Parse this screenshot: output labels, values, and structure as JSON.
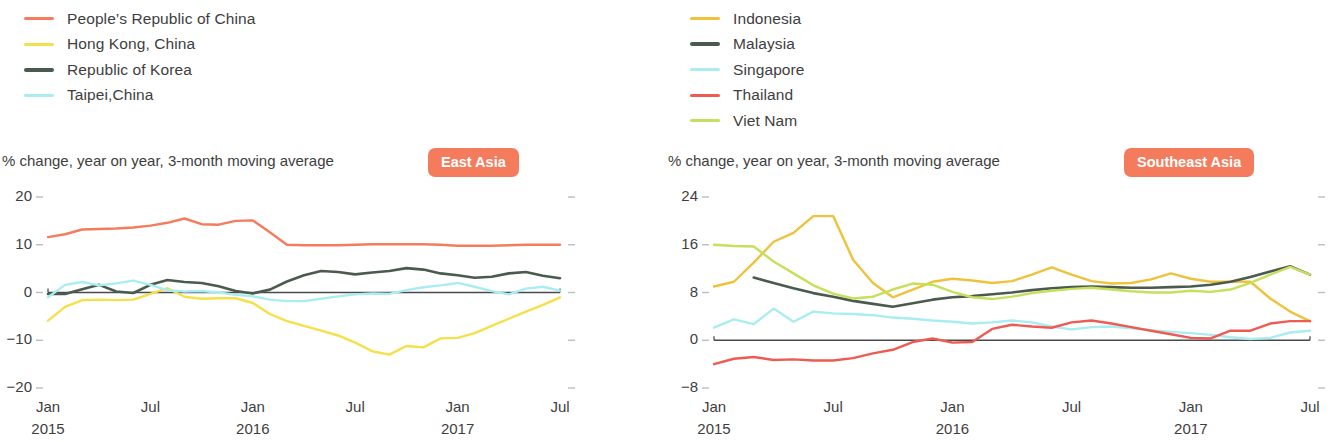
{
  "panels": [
    {
      "badge": "East Asia",
      "subtitle": "% change, year on year, 3-month moving average",
      "legend": [
        {
          "label": "People’s Republic of China",
          "color": "#F47C5C"
        },
        {
          "label": "Hong Kong, China",
          "color": "#F5E04A"
        },
        {
          "label": "Republic of Korea",
          "color": "#4A5B4E"
        },
        {
          "label": "Taipei,China",
          "color": "#A9EDF2"
        }
      ]
    },
    {
      "badge": "Southeast Asia",
      "subtitle": "% change, year on year, 3-month moving average",
      "legend": [
        {
          "label": "Indonesia",
          "color": "#EFC23C"
        },
        {
          "label": "Malaysia",
          "color": "#4A5B4E"
        },
        {
          "label": "Singapore",
          "color": "#A9EDF2"
        },
        {
          "label": "Thailand",
          "color": "#EE5B52"
        },
        {
          "label": "Viet Nam",
          "color": "#C5E05A"
        }
      ]
    }
  ],
  "chart_data": [
    {
      "type": "line",
      "title": "East Asia",
      "subtitle": "% change, year on year, 3-month moving average",
      "xlabel": "",
      "ylabel": "% change, year on year, 3-month moving average",
      "ylim": [
        -20,
        20
      ],
      "yticks": [
        20,
        10,
        0,
        -10,
        -20
      ],
      "xticks": [
        "Jan 2015",
        "Jul",
        "Jan 2016",
        "Jul",
        "Jan 2017",
        "Jul"
      ],
      "x": [
        "2015-01",
        "2015-02",
        "2015-03",
        "2015-04",
        "2015-05",
        "2015-06",
        "2015-07",
        "2015-08",
        "2015-09",
        "2015-10",
        "2015-11",
        "2015-12",
        "2016-01",
        "2016-02",
        "2016-03",
        "2016-04",
        "2016-05",
        "2016-06",
        "2016-07",
        "2016-08",
        "2016-09",
        "2016-10",
        "2016-11",
        "2016-12",
        "2017-01",
        "2017-02",
        "2017-03",
        "2017-04",
        "2017-05",
        "2017-06",
        "2017-07"
      ],
      "grid": false,
      "legend_position": "above-left",
      "series": [
        {
          "name": "People’s Republic of China",
          "color": "#F47C5C",
          "values": [
            11.6,
            12.2,
            13.2,
            13.3,
            13.4,
            13.6,
            14.0,
            14.6,
            15.5,
            14.3,
            14.2,
            15.0,
            15.1,
            12.6,
            10.0,
            9.9,
            9.9,
            9.9,
            10.0,
            10.1,
            10.1,
            10.1,
            10.1,
            10.0,
            9.8,
            9.8,
            9.8,
            9.9,
            10.0,
            10.0,
            10.0
          ]
        },
        {
          "name": "Hong Kong, China",
          "color": "#F5E04A",
          "values": [
            -5.9,
            -3.0,
            -1.6,
            -1.5,
            -1.6,
            -1.5,
            -0.3,
            0.9,
            -0.9,
            -1.3,
            -1.2,
            -1.2,
            -2.2,
            -4.5,
            -6.0,
            -7.0,
            -8.0,
            -9.0,
            -10.5,
            -12.3,
            -13.0,
            -11.2,
            -11.5,
            -9.6,
            -9.5,
            -8.5,
            -7.0,
            -5.5,
            -4.0,
            -2.6,
            -1.0
          ]
        },
        {
          "name": "Republic of Korea",
          "color": "#4A5B4E",
          "values": [
            -0.3,
            -0.3,
            0.7,
            1.6,
            0.2,
            -0.1,
            1.6,
            2.6,
            2.2,
            2.0,
            1.3,
            0.3,
            -0.2,
            0.6,
            2.3,
            3.6,
            4.5,
            4.3,
            3.8,
            4.2,
            4.5,
            5.1,
            4.8,
            4.0,
            3.6,
            3.1,
            3.3,
            4.0,
            4.3,
            3.5,
            3.0
          ]
        },
        {
          "name": "Taipei,China",
          "color": "#A9EDF2",
          "values": [
            -1.0,
            1.6,
            2.2,
            1.5,
            1.9,
            2.5,
            1.6,
            0.5,
            0.2,
            0.3,
            0.0,
            -0.5,
            -0.8,
            -1.5,
            -1.8,
            -1.8,
            -1.3,
            -0.8,
            -0.4,
            -0.2,
            -0.3,
            0.5,
            1.1,
            1.5,
            2.0,
            1.2,
            0.3,
            -0.4,
            0.8,
            1.2,
            0.4
          ]
        }
      ]
    },
    {
      "type": "line",
      "title": "Southeast Asia",
      "subtitle": "% change, year on year, 3-month moving average",
      "xlabel": "",
      "ylabel": "% change, year on year, 3-month moving average",
      "ylim": [
        -8,
        24
      ],
      "yticks": [
        24,
        16,
        8,
        0,
        -8
      ],
      "xticks": [
        "Jan 2015",
        "Jul",
        "Jan 2016",
        "Jul",
        "Jan 2017",
        "Jul"
      ],
      "x": [
        "2015-01",
        "2015-02",
        "2015-03",
        "2015-04",
        "2015-05",
        "2015-06",
        "2015-07",
        "2015-08",
        "2015-09",
        "2015-10",
        "2015-11",
        "2015-12",
        "2016-01",
        "2016-02",
        "2016-03",
        "2016-04",
        "2016-05",
        "2016-06",
        "2016-07",
        "2016-08",
        "2016-09",
        "2016-10",
        "2016-11",
        "2016-12",
        "2017-01",
        "2017-02",
        "2017-03",
        "2017-04",
        "2017-05",
        "2017-06",
        "2017-07"
      ],
      "grid": false,
      "legend_position": "above-left",
      "series": [
        {
          "name": "Indonesia",
          "color": "#EFC23C",
          "values": [
            9.0,
            9.8,
            13.0,
            16.5,
            18.0,
            20.8,
            20.8,
            13.5,
            9.6,
            7.2,
            8.5,
            9.8,
            10.3,
            10.0,
            9.6,
            9.9,
            11.0,
            12.2,
            11.0,
            9.9,
            9.5,
            9.6,
            10.2,
            11.2,
            10.3,
            9.8,
            9.8,
            9.8,
            7.0,
            4.8,
            3.2
          ]
        },
        {
          "name": "Malaysia",
          "color": "#4A5B4E",
          "values": [
            null,
            null,
            10.5,
            9.6,
            8.7,
            7.9,
            7.3,
            6.6,
            6.1,
            5.6,
            6.2,
            6.8,
            7.2,
            7.4,
            7.7,
            8.0,
            8.4,
            8.7,
            8.9,
            9.0,
            8.9,
            8.8,
            8.8,
            8.9,
            9.0,
            9.3,
            9.8,
            10.6,
            11.5,
            12.4,
            11.0
          ]
        },
        {
          "name": "Singapore",
          "color": "#A9EDF2",
          "values": [
            2.1,
            3.5,
            2.7,
            5.3,
            3.1,
            4.8,
            4.5,
            4.4,
            4.2,
            3.8,
            3.6,
            3.3,
            3.1,
            2.8,
            3.0,
            3.3,
            3.0,
            2.3,
            1.8,
            2.2,
            2.3,
            2.0,
            1.7,
            1.4,
            1.2,
            0.9,
            0.5,
            0.2,
            0.4,
            1.3,
            1.6
          ]
        },
        {
          "name": "Thailand",
          "color": "#EE5B52",
          "values": [
            -4.0,
            -3.1,
            -2.8,
            -3.3,
            -3.2,
            -3.4,
            -3.4,
            -3.0,
            -2.2,
            -1.6,
            -0.3,
            0.3,
            -0.4,
            -0.3,
            1.9,
            2.6,
            2.3,
            2.1,
            3.0,
            3.3,
            2.8,
            2.2,
            1.6,
            1.0,
            0.4,
            0.3,
            1.6,
            1.6,
            2.8,
            3.2,
            3.2
          ]
        },
        {
          "name": "Viet Nam",
          "color": "#C5E05A",
          "values": [
            16.0,
            15.8,
            15.7,
            13.2,
            11.2,
            9.2,
            7.8,
            7.0,
            7.3,
            8.5,
            9.5,
            9.3,
            8.1,
            7.2,
            6.9,
            7.3,
            7.9,
            8.3,
            8.6,
            8.8,
            8.5,
            8.2,
            8.0,
            8.0,
            8.3,
            8.1,
            8.5,
            9.6,
            11.0,
            12.3,
            11.0
          ]
        }
      ]
    }
  ]
}
